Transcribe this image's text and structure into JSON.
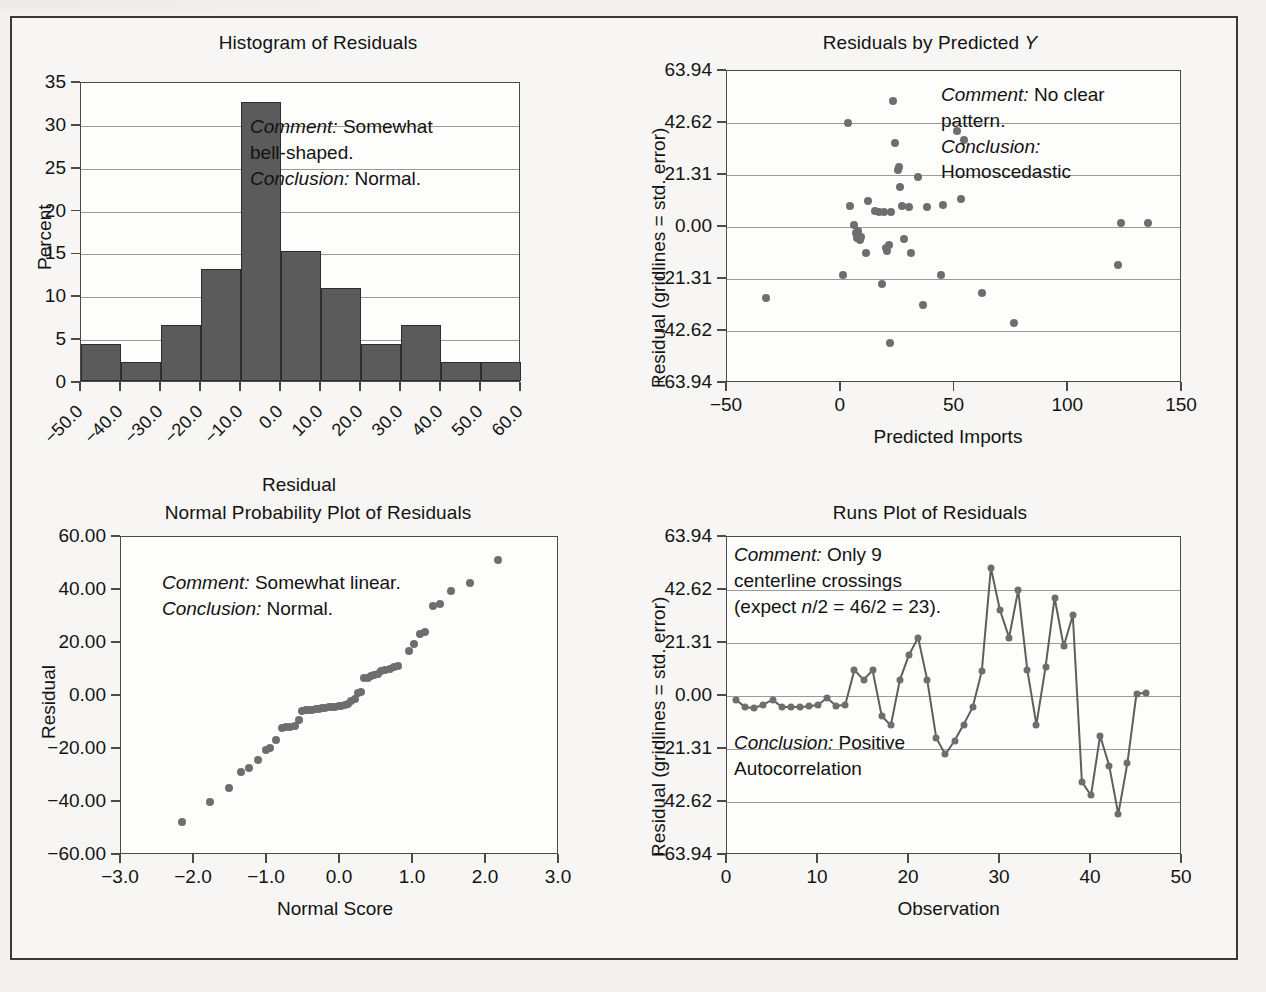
{
  "figure": {
    "background_color": "#f2f1ef",
    "frame_color": "#3a3a3a",
    "bar_color": "#5b5b5b",
    "dot_color": "#6e6e6e",
    "gridline_color": "#9a9a9a"
  },
  "panels": {
    "histogram": {
      "title": "Histogram of Residuals",
      "note_line1_label": "Comment:",
      "note_line1_text": " Somewhat",
      "note_line2_text": "bell-shaped.",
      "note_line3_label": "Conclusion:",
      "note_line3_text": " Normal."
    },
    "scatter": {
      "title_pre": "Residuals by Predicted ",
      "title_italic": "Y",
      "note_line1_label": "Comment:",
      "note_line1_text": " No clear",
      "note_line2_text": "pattern.",
      "note_line3_label": "Conclusion:",
      "note_line4_text": "Homoscedastic"
    },
    "npp": {
      "title": "Normal Probability Plot of Residuals",
      "note_line1_label": "Comment:",
      "note_line1_text": " Somewhat linear.",
      "note_line2_label": "Conclusion:",
      "note_line2_text": " Normal."
    },
    "runs": {
      "title": "Runs Plot of Residuals",
      "note_line1_label": "Comment:",
      "note_line1_text": " Only 9",
      "note_line2_text": "centerline crossings",
      "note_line3_pre": "(expect ",
      "note_line3_italic": "n",
      "note_line3_post": "/2 = 46/2 = 23).",
      "note_line4_label": "Conclusion:",
      "note_line4_text": " Positive",
      "note_line5_text": "Autocorrelation"
    }
  },
  "chart_data": [
    {
      "id": "histogram-of-residuals",
      "type": "bar",
      "title": "Histogram of Residuals",
      "xlabel": "Residual",
      "ylabel": "Percent",
      "ylim": [
        0,
        35
      ],
      "yticks": [
        0,
        5,
        10,
        15,
        20,
        25,
        30,
        35
      ],
      "ytick_labels": [
        "0",
        "5",
        "10",
        "15",
        "20",
        "25",
        "30",
        "35"
      ],
      "xlim": [
        -50,
        60
      ],
      "xtick_labels": [
        "−50.0",
        "−40.0",
        "−30.0",
        "−20.0",
        "−10.0",
        "0.0",
        "10.0",
        "20.0",
        "30.0",
        "40.0",
        "50.0",
        "60.0"
      ],
      "bin_edges": [
        -50,
        -40,
        -30,
        -20,
        -10,
        0,
        10,
        20,
        30,
        40,
        50,
        60
      ],
      "categories": [
        "-50 to -40",
        "-40 to -30",
        "-30 to -20",
        "-20 to -10",
        "-10 to 0",
        "0 to 10",
        "10 to 20",
        "20 to 30",
        "30 to 40",
        "40 to 50",
        "50 to 60"
      ],
      "values": [
        4.35,
        2.17,
        6.52,
        13.04,
        32.61,
        15.22,
        10.87,
        4.35,
        6.52,
        2.17,
        2.17
      ],
      "grid": true,
      "legend": "none"
    },
    {
      "id": "residuals-by-predicted-y",
      "type": "scatter",
      "title": "Residuals by Predicted Y",
      "xlabel": "Predicted Imports",
      "ylabel": "Residual (gridlines = std. error)",
      "xlim": [
        -50,
        150
      ],
      "xticks": [
        -50,
        0,
        50,
        100,
        150
      ],
      "xtick_labels": [
        "−50",
        "0",
        "50",
        "100",
        "150"
      ],
      "ylim": [
        -63.94,
        63.94
      ],
      "yticks": [
        -63.94,
        -42.62,
        -21.31,
        0.0,
        21.31,
        42.62,
        63.94
      ],
      "ytick_labels": [
        "−63.94",
        "−42.62",
        "−21.31",
        "0.00",
        "21.31",
        "42.62",
        "63.94"
      ],
      "grid": true,
      "legend": "none",
      "points": [
        [
          -33,
          -29
        ],
        [
          1,
          -19.5
        ],
        [
          3,
          42.6
        ],
        [
          4,
          8.5
        ],
        [
          6,
          0.8
        ],
        [
          6.5,
          -2.5
        ],
        [
          7,
          -4.5
        ],
        [
          7.5,
          -1.5
        ],
        [
          8,
          -3.5
        ],
        [
          8.5,
          -5.5
        ],
        [
          9,
          -4.0
        ],
        [
          11,
          -10.5
        ],
        [
          12,
          10.5
        ],
        [
          15,
          6.5
        ],
        [
          17,
          6.3
        ],
        [
          18,
          -23.5
        ],
        [
          19,
          6.2
        ],
        [
          20,
          -8.5
        ],
        [
          20.5,
          -10.0
        ],
        [
          21,
          -7.5
        ],
        [
          21.5,
          -47.5
        ],
        [
          22,
          6.3
        ],
        [
          23,
          51.5
        ],
        [
          24,
          34.5
        ],
        [
          25,
          23.5
        ],
        [
          25.5,
          24.5
        ],
        [
          26,
          16.5
        ],
        [
          27,
          8.5
        ],
        [
          28,
          -5.0
        ],
        [
          30,
          8.0
        ],
        [
          31,
          -10.5
        ],
        [
          34,
          20.5
        ],
        [
          36,
          -32.0
        ],
        [
          38,
          8.0
        ],
        [
          44,
          -19.5
        ],
        [
          45,
          9.0
        ],
        [
          51,
          39.5
        ],
        [
          53,
          11.5
        ],
        [
          54,
          35.5
        ],
        [
          62,
          -27.0
        ],
        [
          76,
          -39.5
        ],
        [
          122,
          -15.5
        ],
        [
          123,
          1.5
        ],
        [
          135,
          1.8
        ]
      ]
    },
    {
      "id": "normal-probability-plot-of-residuals",
      "type": "scatter",
      "title": "Normal Probability Plot of Residuals",
      "xlabel": "Normal Score",
      "ylabel": "Residual",
      "xlim": [
        -3.0,
        3.0
      ],
      "xticks": [
        -3.0,
        -2.0,
        -1.0,
        0.0,
        1.0,
        2.0,
        3.0
      ],
      "xtick_labels": [
        "−3.0",
        "−2.0",
        "−1.0",
        "0.0",
        "1.0",
        "2.0",
        "3.0"
      ],
      "ylim": [
        -60.0,
        60.0
      ],
      "yticks": [
        -60.0,
        -40.0,
        -20.0,
        0.0,
        20.0,
        40.0,
        60.0
      ],
      "ytick_labels": [
        "−60.00",
        "−40.00",
        "−20.00",
        "0.00",
        "20.00",
        "40.00",
        "60.00"
      ],
      "grid": false,
      "legend": "none",
      "points": [
        [
          -2.17,
          -47.5
        ],
        [
          -1.78,
          -40.0
        ],
        [
          -1.52,
          -34.8
        ],
        [
          -1.35,
          -28.8
        ],
        [
          -1.25,
          -27.0
        ],
        [
          -1.12,
          -24.0
        ],
        [
          -1.02,
          -20.5
        ],
        [
          -0.96,
          -19.5
        ],
        [
          -0.88,
          -16.5
        ],
        [
          -0.8,
          -12.0
        ],
        [
          -0.74,
          -11.8
        ],
        [
          -0.68,
          -11.7
        ],
        [
          -0.62,
          -11.5
        ],
        [
          -0.56,
          -9.0
        ],
        [
          -0.52,
          -5.5
        ],
        [
          -0.47,
          -5.4
        ],
        [
          -0.42,
          -5.3
        ],
        [
          -0.38,
          -5.2
        ],
        [
          -0.33,
          -5.0
        ],
        [
          -0.29,
          -4.8
        ],
        [
          -0.24,
          -4.6
        ],
        [
          -0.2,
          -4.4
        ],
        [
          -0.15,
          -4.3
        ],
        [
          -0.11,
          -4.1
        ],
        [
          -0.07,
          -4.0
        ],
        [
          -0.02,
          -3.9
        ],
        [
          0.02,
          -3.7
        ],
        [
          0.07,
          -3.4
        ],
        [
          0.11,
          -3.0
        ],
        [
          0.15,
          -2.0
        ],
        [
          0.2,
          -1.2
        ],
        [
          0.24,
          1.0
        ],
        [
          0.29,
          1.5
        ],
        [
          0.33,
          6.8
        ],
        [
          0.38,
          6.9
        ],
        [
          0.42,
          7.6
        ],
        [
          0.47,
          8.0
        ],
        [
          0.52,
          8.3
        ],
        [
          0.56,
          9.5
        ],
        [
          0.62,
          9.8
        ],
        [
          0.68,
          10.3
        ],
        [
          0.74,
          10.8
        ],
        [
          0.8,
          11.2
        ],
        [
          0.95,
          17.0
        ],
        [
          1.02,
          19.8
        ],
        [
          1.1,
          23.5
        ],
        [
          1.17,
          24.0
        ],
        [
          1.27,
          34.0
        ],
        [
          1.37,
          34.8
        ],
        [
          1.52,
          39.8
        ],
        [
          1.78,
          42.5
        ],
        [
          2.17,
          51.5
        ]
      ]
    },
    {
      "id": "runs-plot-of-residuals",
      "type": "line",
      "title": "Runs Plot of Residuals",
      "xlabel": "Observation",
      "ylabel": "Residual (gridlines = std. error)",
      "xlim": [
        0,
        50
      ],
      "xticks": [
        0,
        10,
        20,
        30,
        40,
        50
      ],
      "xtick_labels": [
        "0",
        "10",
        "20",
        "30",
        "40",
        "50"
      ],
      "ylim": [
        -63.94,
        63.94
      ],
      "yticks": [
        -63.94,
        -42.62,
        -21.31,
        0.0,
        21.31,
        42.62,
        63.94
      ],
      "ytick_labels": [
        "−63.94",
        "−42.62",
        "−21.31",
        "0.00",
        "21.31",
        "42.62",
        "63.94"
      ],
      "grid": true,
      "legend": "none",
      "markers": true,
      "x": [
        1,
        2,
        3,
        4,
        5,
        6,
        7,
        8,
        9,
        10,
        11,
        12,
        13,
        14,
        15,
        16,
        17,
        18,
        19,
        20,
        21,
        22,
        23,
        24,
        25,
        26,
        27,
        28,
        29,
        30,
        31,
        32,
        33,
        34,
        35,
        36,
        37,
        38,
        39,
        40,
        41,
        42,
        43,
        44,
        45,
        46
      ],
      "values": [
        -1.5,
        -4.5,
        -4.8,
        -3.5,
        -1.5,
        -4.3,
        -4.5,
        -4.3,
        -4.2,
        -3.5,
        -0.8,
        -4.0,
        -3.5,
        10.5,
        6.5,
        10.3,
        -8.0,
        -11.8,
        6.5,
        16.5,
        23.5,
        6.5,
        -17.0,
        -23.5,
        -18.0,
        -11.5,
        -4.5,
        10.0,
        51.5,
        34.5,
        23.5,
        42.6,
        10.5,
        -11.5,
        11.5,
        39.5,
        20.0,
        32.5,
        -34.5,
        -40.0,
        -16.0,
        -28.0,
        -47.5,
        -27.0,
        1.0,
        1.2
      ]
    }
  ]
}
